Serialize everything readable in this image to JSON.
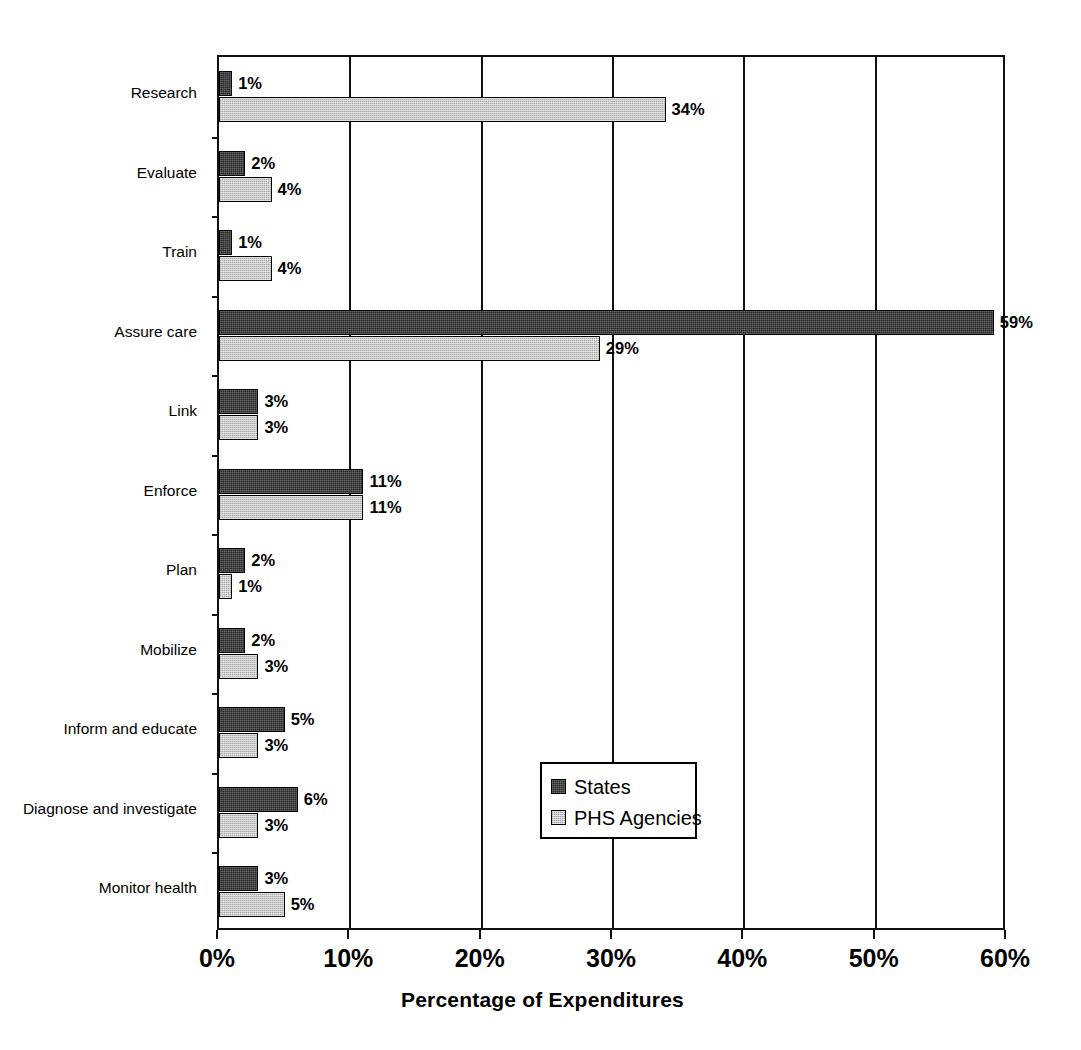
{
  "chart_data": {
    "type": "bar",
    "orientation": "horizontal",
    "title": "",
    "xlabel": "Percentage of Expenditures",
    "ylabel": "",
    "xlim": [
      0,
      60
    ],
    "xticks": [
      "0%",
      "10%",
      "20%",
      "30%",
      "40%",
      "50%",
      "60%"
    ],
    "xtick_values": [
      0,
      10,
      20,
      30,
      40,
      50,
      60
    ],
    "grid": "vertical",
    "legend_position": "center",
    "categories": [
      "Research",
      "Evaluate",
      "Train",
      "Assure care",
      "Link",
      "Enforce",
      "Plan",
      "Mobilize",
      "Inform and educate",
      "Diagnose and investigate",
      "Monitor health"
    ],
    "series": [
      {
        "name": "States",
        "color": "#242424",
        "values": [
          1,
          2,
          1,
          59,
          3,
          11,
          2,
          2,
          5,
          6,
          3
        ],
        "labels": [
          "1%",
          "2%",
          "1%",
          "59%",
          "3%",
          "11%",
          "2%",
          "2%",
          "5%",
          "6%",
          "3%"
        ]
      },
      {
        "name": "PHS Agencies",
        "color": "#c9c9c9",
        "values": [
          34,
          4,
          4,
          29,
          3,
          11,
          1,
          3,
          3,
          3,
          5
        ],
        "labels": [
          "34%",
          "4%",
          "4%",
          "29%",
          "3%",
          "11%",
          "1%",
          "3%",
          "3%",
          "3%",
          "5%"
        ]
      }
    ]
  },
  "legend": {
    "entries": [
      {
        "label": "States",
        "swatch": "dark-checker-swatch"
      },
      {
        "label": "PHS Agencies",
        "swatch": "light-checker-swatch"
      }
    ]
  }
}
